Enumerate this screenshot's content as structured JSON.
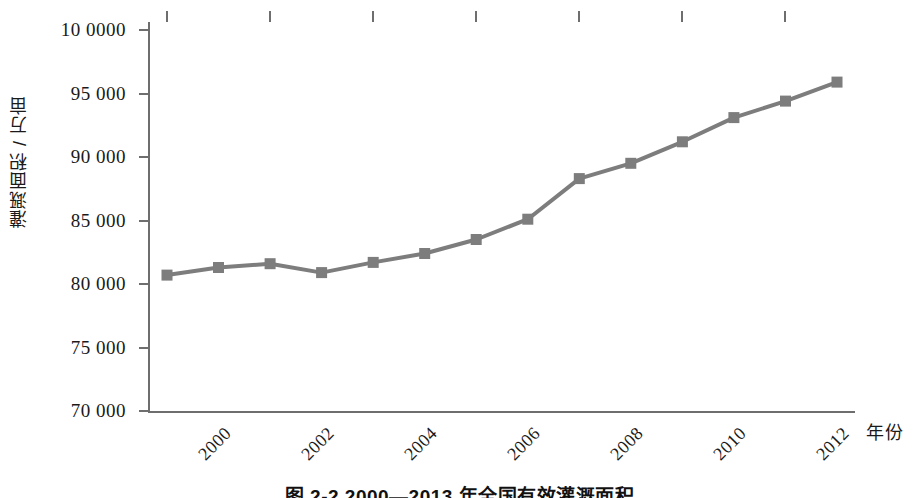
{
  "chart_data": {
    "type": "line",
    "title": "",
    "caption": "图 2-2  2000—2013 年全国有效灌溉面积",
    "xlabel": "年份",
    "ylabel": "灌溉面积 / 万亩",
    "x": [
      2000,
      2001,
      2002,
      2003,
      2004,
      2005,
      2006,
      2007,
      2008,
      2009,
      2010,
      2011,
      2012,
      2013
    ],
    "values": [
      80700,
      81300,
      81600,
      80900,
      81700,
      82400,
      83500,
      85100,
      88300,
      89500,
      91200,
      93100,
      94400,
      95900
    ],
    "series": [
      {
        "name": "全国有效灌溉面积",
        "values": [
          80700,
          81300,
          81600,
          80900,
          81700,
          82400,
          83500,
          85100,
          88300,
          89500,
          91200,
          93100,
          94400,
          95900
        ]
      }
    ],
    "xlim": [
      2000,
      2013
    ],
    "ylim": [
      70000,
      100000
    ],
    "x_tick_labels": [
      "2000",
      "2002",
      "2004",
      "2006",
      "2008",
      "2010",
      "2012"
    ],
    "x_tick_values": [
      2000,
      2002,
      2004,
      2006,
      2008,
      2010,
      2012
    ],
    "y_tick_labels": [
      "70 000",
      "75 000",
      "80 000",
      "85 000",
      "90 000",
      "95 000",
      "10 0000"
    ],
    "y_tick_values": [
      70000,
      75000,
      80000,
      85000,
      90000,
      95000,
      100000
    ],
    "grid": false,
    "legend": "none",
    "marker": "square",
    "series_color": "#7d7d7d",
    "axis_color": "#6e6e6e"
  }
}
